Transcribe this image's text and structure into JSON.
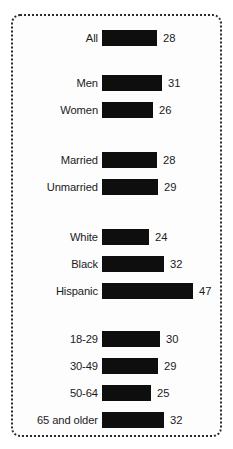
{
  "chart_data": {
    "type": "bar",
    "title": "",
    "subtitle": "",
    "xlabel": "",
    "ylabel": "",
    "orientation": "horizontal",
    "grid": false,
    "legend": false,
    "xlim": [
      0,
      50
    ],
    "value_suffix": "",
    "categories": [
      "All",
      "Men",
      "Women",
      "Married",
      "Unmarried",
      "White",
      "Black",
      "Hispanic",
      "18-29",
      "30-49",
      "50-64",
      "65 and older"
    ],
    "values": [
      28,
      31,
      26,
      28,
      29,
      24,
      32,
      47,
      30,
      29,
      25,
      32
    ],
    "groups": [
      {
        "name": "total",
        "labels": [
          "All"
        ],
        "values": [
          28
        ]
      },
      {
        "name": "gender",
        "labels": [
          "Men",
          "Women"
        ],
        "values": [
          31,
          26
        ]
      },
      {
        "name": "marital-status",
        "labels": [
          "Married",
          "Unmarried"
        ],
        "values": [
          28,
          29
        ]
      },
      {
        "name": "race-ethnicity",
        "labels": [
          "White",
          "Black",
          "Hispanic"
        ],
        "values": [
          24,
          32,
          47
        ]
      },
      {
        "name": "age",
        "labels": [
          "18-29",
          "30-49",
          "50-64",
          "65 and older"
        ],
        "values": [
          30,
          29,
          25,
          32
        ]
      }
    ],
    "colors": {
      "bar": "#0e0e0e",
      "text": "#1b1b1b",
      "background": "#fdfdfd",
      "border": "#2b2b2b"
    }
  },
  "rows": [
    {
      "label": "All",
      "value": "28",
      "top": 29,
      "width": 55,
      "num": 28
    },
    {
      "label": "Men",
      "value": "31",
      "top": 74,
      "width": 60,
      "num": 31
    },
    {
      "label": "Women",
      "value": "26",
      "top": 101,
      "width": 51,
      "num": 26
    },
    {
      "label": "Married",
      "value": "28",
      "top": 151,
      "width": 55,
      "num": 28
    },
    {
      "label": "Unmarried",
      "value": "29",
      "top": 178,
      "width": 56,
      "num": 29
    },
    {
      "label": "White",
      "value": "24",
      "top": 228,
      "width": 47,
      "num": 24
    },
    {
      "label": "Black",
      "value": "32",
      "top": 255,
      "width": 62,
      "num": 32
    },
    {
      "label": "Hispanic",
      "value": "47",
      "top": 282,
      "width": 91,
      "num": 47
    },
    {
      "label": "18-29",
      "value": "30",
      "top": 330,
      "width": 58,
      "num": 30
    },
    {
      "label": "30-49",
      "value": "29",
      "top": 357,
      "width": 56,
      "num": 29
    },
    {
      "label": "50-64",
      "value": "25",
      "top": 384,
      "width": 49,
      "num": 25
    },
    {
      "label": "65 and older",
      "value": "32",
      "top": 411,
      "width": 62,
      "num": 32
    }
  ]
}
